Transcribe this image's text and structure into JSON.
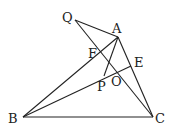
{
  "diagram": {
    "type": "geometry",
    "points": {
      "Q": {
        "label": "Q",
        "x": 75,
        "y": 20,
        "lx": 62,
        "ly": 22
      },
      "A": {
        "label": "A",
        "x": 118,
        "y": 37,
        "lx": 112,
        "ly": 33
      },
      "B": {
        "label": "B",
        "x": 23,
        "y": 117,
        "lx": 8,
        "ly": 123
      },
      "C": {
        "label": "C",
        "x": 153,
        "y": 117,
        "lx": 155,
        "ly": 123
      },
      "E": {
        "label": "E",
        "x": 131,
        "y": 66,
        "lx": 134,
        "ly": 67
      },
      "F": {
        "label": "F",
        "x": 100,
        "y": 52,
        "lx": 88,
        "ly": 58
      },
      "O": {
        "label": "O",
        "x": 116,
        "y": 72,
        "lx": 111,
        "ly": 86
      },
      "P": {
        "label": "P",
        "x": 104,
        "y": 76,
        "lx": 97,
        "ly": 91
      }
    },
    "segments": [
      [
        "Q",
        "A"
      ],
      [
        "Q",
        "C"
      ],
      [
        "A",
        "B"
      ],
      [
        "A",
        "C"
      ],
      [
        "B",
        "C"
      ],
      [
        "B",
        "E"
      ],
      [
        "A",
        "P"
      ],
      [
        "B",
        "P"
      ]
    ],
    "labels": [
      "Q",
      "A",
      "F",
      "E",
      "P",
      "O",
      "B",
      "C"
    ]
  }
}
